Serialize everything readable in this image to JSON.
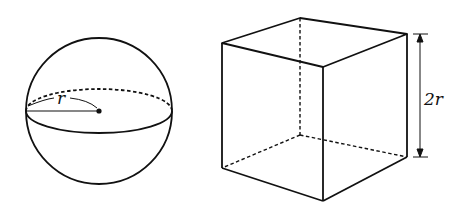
{
  "sphere": {
    "radius_label": "r",
    "center": [
      99,
      111
    ],
    "radius": 73
  },
  "cube": {
    "edge_label": "2r"
  },
  "colors": {
    "stroke": "#111111",
    "background": "#ffffff"
  }
}
